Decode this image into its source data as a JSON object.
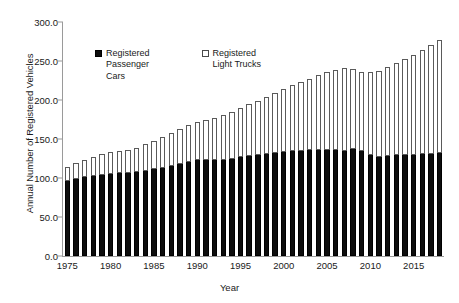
{
  "chart_data": {
    "type": "bar",
    "stacked": true,
    "title": "",
    "xlabel": "Year",
    "ylabel": "Annual Number of Registered Vehicles",
    "ylim": [
      0.0,
      300.0
    ],
    "ytick_labels": [
      "0.0",
      "50.0",
      "100.0",
      "150.0",
      "200.0",
      "250.0",
      "300.0"
    ],
    "ytick_values": [
      0,
      50,
      100,
      150,
      200,
      250,
      300
    ],
    "xtick_labels": [
      "1975",
      "1980",
      "1985",
      "1990",
      "1995",
      "2000",
      "2005",
      "2010",
      "2015"
    ],
    "xtick_values": [
      1975,
      1980,
      1985,
      1990,
      1995,
      2000,
      2005,
      2010,
      2015
    ],
    "grid": false,
    "legend_position": "upper-left-inside",
    "categories": [
      1975,
      1976,
      1977,
      1978,
      1979,
      1980,
      1981,
      1982,
      1983,
      1984,
      1985,
      1986,
      1987,
      1988,
      1989,
      1990,
      1991,
      1992,
      1993,
      1994,
      1995,
      1996,
      1997,
      1998,
      1999,
      2000,
      2001,
      2002,
      2003,
      2004,
      2005,
      2006,
      2007,
      2008,
      2009,
      2010,
      2011,
      2012,
      2013,
      2014,
      2015,
      2016,
      2017,
      2018
    ],
    "series": [
      {
        "name": "Registered Passenger Cars",
        "fill": "solid-black",
        "values": [
          96.5,
          99.0,
          101.0,
          103.0,
          104.5,
          105.5,
          106.0,
          106.5,
          107.5,
          109.0,
          111.0,
          113.0,
          115.5,
          118.0,
          120.0,
          122.5,
          123.0,
          122.5,
          123.5,
          125.0,
          127.0,
          128.5,
          129.5,
          130.5,
          131.5,
          133.0,
          134.5,
          135.0,
          135.5,
          136.0,
          136.5,
          135.5,
          135.0,
          137.0,
          134.0,
          130.0,
          127.5,
          128.0,
          129.0,
          129.5,
          130.0,
          130.5,
          131.0,
          131.5
        ]
      },
      {
        "name": "Registered Light Trucks",
        "fill": "open-hatched",
        "values": [
          17.5,
          20.0,
          22.0,
          24.5,
          26.0,
          27.5,
          28.5,
          29.5,
          31.5,
          34.0,
          37.0,
          39.5,
          42.5,
          45.0,
          47.5,
          49.5,
          52.0,
          54.5,
          57.0,
          59.5,
          62.5,
          66.0,
          69.5,
          73.5,
          77.5,
          81.0,
          84.5,
          88.5,
          92.0,
          95.5,
          99.0,
          102.5,
          106.0,
          103.0,
          101.5,
          106.5,
          110.0,
          114.5,
          119.0,
          123.5,
          128.0,
          133.0,
          139.0,
          145.5
        ]
      }
    ],
    "totals": [
      114.0,
      119.0,
      123.0,
      127.5,
      130.5,
      133.0,
      134.5,
      136.0,
      139.0,
      143.0,
      148.0,
      152.5,
      158.0,
      163.0,
      167.5,
      172.0,
      175.0,
      177.0,
      180.5,
      184.5,
      189.5,
      194.5,
      199.0,
      204.0,
      209.0,
      214.0,
      219.0,
      223.5,
      227.5,
      231.5,
      235.5,
      238.0,
      241.0,
      240.0,
      235.5,
      236.5,
      237.5,
      242.5,
      248.0,
      253.0,
      258.0,
      263.5,
      270.0,
      277.0
    ]
  },
  "legend": {
    "entries": [
      {
        "label": "Registered\nPassenger\nCars",
        "swatch": "filled-square"
      },
      {
        "label": "Registered\nLight Trucks",
        "swatch": "open-square"
      }
    ]
  },
  "colors": {
    "cars": "#0d0d0d",
    "trucks_outline": "#5a5a5a",
    "trucks_fill": "#ffffff",
    "axis": "#9a9a9a",
    "text": "#1a1a1a",
    "background": "#ffffff"
  }
}
